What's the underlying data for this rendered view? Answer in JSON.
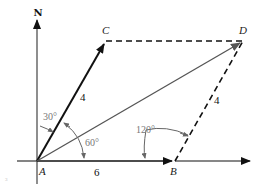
{
  "diagram": {
    "north_label": "N",
    "points": {
      "A": "A",
      "B": "B",
      "C": "C",
      "D": "D"
    },
    "magnitudes": {
      "AC": "4",
      "AB": "6",
      "BD": "4"
    },
    "angles": {
      "north_to_AC": "30°",
      "AC_to_AB": "60°",
      "at_B": "120°"
    },
    "stray_mark": "3",
    "colors": {
      "primary_vector": "#111111",
      "resultant_vector": "#555555",
      "angle_text": "#777777",
      "dashed": "#111111"
    }
  }
}
